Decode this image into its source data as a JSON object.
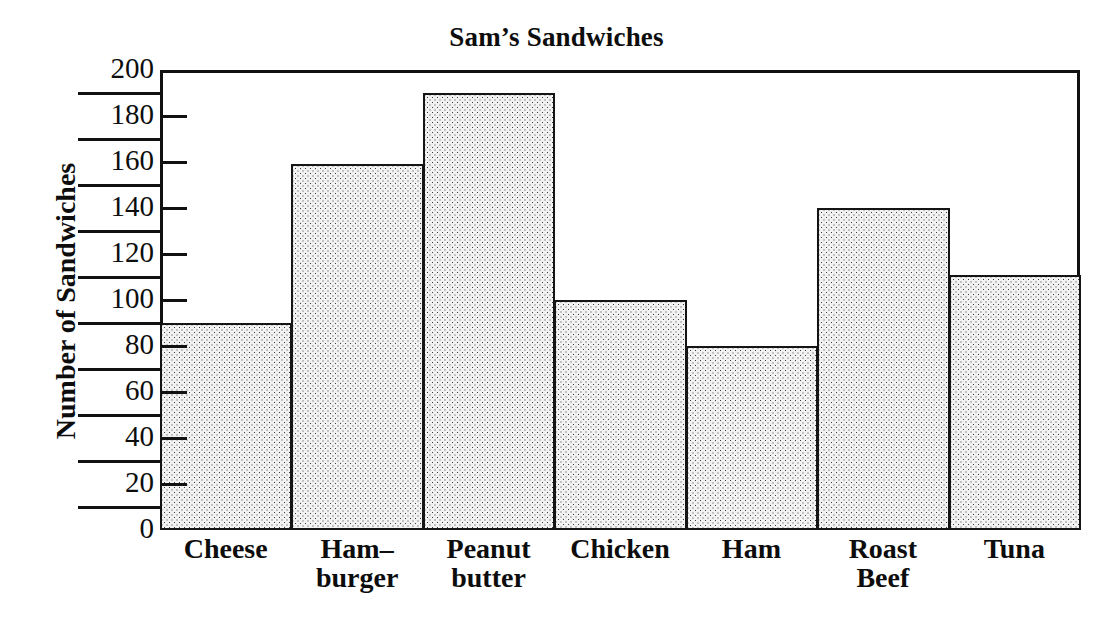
{
  "chart_data": {
    "type": "bar",
    "title": "Sam’s Sandwiches",
    "xlabel": "",
    "ylabel": "Number of Sandwiches",
    "ylim": [
      0,
      200
    ],
    "grid": false,
    "legend": false,
    "categories": [
      "Cheese",
      "Ham-burger",
      "Peanut butter",
      "Chicken",
      "Ham",
      "Roast Beef",
      "Tuna"
    ],
    "category_lines": [
      [
        "Cheese"
      ],
      [
        "Ham–",
        "burger"
      ],
      [
        "Peanut",
        "butter"
      ],
      [
        "Chicken"
      ],
      [
        "Ham"
      ],
      [
        "Roast",
        "Beef"
      ],
      [
        "Tuna"
      ]
    ],
    "values": [
      90,
      159,
      190,
      100,
      80,
      140,
      111
    ],
    "y_tick_labels": [
      "0",
      "20",
      "40",
      "60",
      "80",
      "100",
      "120",
      "140",
      "160",
      "180",
      "200"
    ],
    "y_tick_values": [
      0,
      20,
      40,
      60,
      80,
      100,
      120,
      140,
      160,
      180,
      200
    ],
    "y_minor_rule_values": [
      10,
      30,
      50,
      70,
      90,
      110,
      130,
      150,
      170,
      190
    ],
    "bar_fill": "#f2f2f2",
    "bar_edge": "#141414",
    "axis_color": "#111111",
    "text_color": "#0d0d0d",
    "background": "#ffffff"
  }
}
